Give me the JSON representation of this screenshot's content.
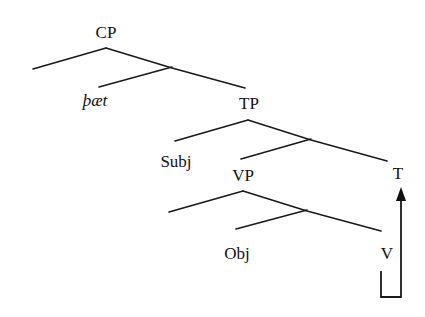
{
  "diagram": {
    "type": "syntax-tree",
    "nodes": {
      "cp": "CP",
      "complementizer": "þæt",
      "tp": "TP",
      "subj": "Subj",
      "vp": "VP",
      "t": "T",
      "obj": "Obj",
      "v": "V"
    },
    "movement": {
      "from": "V",
      "to": "T",
      "description": "V-to-T head movement arrow"
    },
    "colors": {
      "ink": "#111111",
      "background": "#ffffff"
    }
  }
}
